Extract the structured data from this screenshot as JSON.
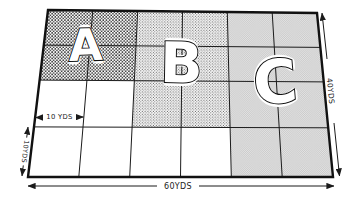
{
  "diagram": {
    "field": {
      "grid": {
        "columns": 6,
        "rows": 4
      },
      "zones": [
        {
          "label": "A",
          "pattern": "coarse-black-dots",
          "grid_columns": "1-2",
          "grid_rows": "1-2"
        },
        {
          "label": "B",
          "pattern": "medium-dots",
          "grid_columns": "3-4",
          "grid_rows": "1-3"
        },
        {
          "label": "C",
          "pattern": "fine-gray-halftone",
          "grid_columns": "5-6",
          "grid_rows": "1-4"
        }
      ],
      "dimensions": {
        "bottom_width": "60YDS",
        "right_height": "40YDS",
        "cell_width": "10 YDS",
        "cell_height": "10YDS"
      },
      "colors": {
        "background": "#ffffff",
        "line": "#1b1b1b",
        "letter_fill": "#ffffff",
        "zone_c_gray": "#d8d8d8"
      }
    }
  }
}
